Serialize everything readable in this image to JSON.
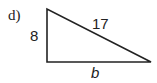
{
  "problem_label": "d)",
  "triangle": {
    "type": "right triangle",
    "sides": {
      "vertical_leg": "8",
      "hypotenuse": "17",
      "horizontal_leg": "b"
    },
    "stroke_color": "#222222"
  }
}
